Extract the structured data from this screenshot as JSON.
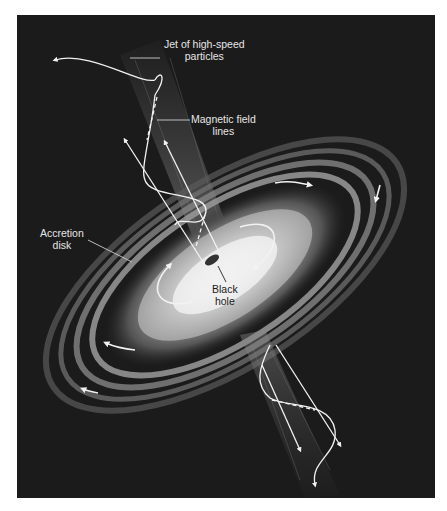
{
  "figure": {
    "background": "#1b1b1b",
    "labels": {
      "jet": {
        "line1": "Jet of high-speed",
        "line2": "particles"
      },
      "magnetic": {
        "line1": "Magnetic field",
        "line2": "lines"
      },
      "disk": {
        "line1": "Accretion",
        "line2": "disk"
      },
      "black_hole": {
        "line1": "Black",
        "line2": "hole"
      }
    }
  }
}
